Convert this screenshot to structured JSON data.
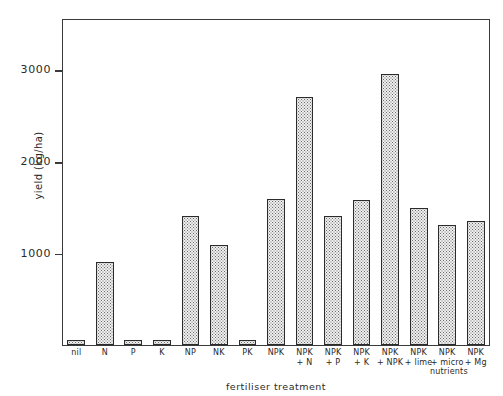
{
  "figure": {
    "top_caption_remnant": "",
    "background": "#ffffff",
    "frame_color": "#3a3a3a",
    "bar_fill": "#efefef",
    "bar_edge": "#2b2b2b"
  },
  "chart_data": {
    "type": "bar",
    "title": "",
    "xlabel": "fertiliser treatment",
    "ylabel": "yield (kg/ha)",
    "categories": [
      "nil",
      "N",
      "P",
      "K",
      "NP",
      "NK",
      "PK",
      "NPK",
      "NPK\n+ N",
      "NPK\n+ P",
      "NPK\n+ K",
      "NPK\n+ NPK",
      "NPK\n+ lime",
      "NPK\n+ micro\nnutrients",
      "NPK\n+ Mg"
    ],
    "values": [
      55,
      905,
      60,
      60,
      1405,
      1090,
      55,
      1590,
      2700,
      1410,
      1580,
      2950,
      1490,
      1310,
      1350
    ],
    "ylim": [
      0,
      3560
    ],
    "yticks": [
      1000,
      2000,
      3000
    ],
    "ytick_labels": [
      "1000",
      "2000",
      "3000"
    ],
    "xlim_note": "15 categories, equal spacing",
    "grid": false,
    "legend": null,
    "bar_style": "stippled / dotted fill with black outline"
  }
}
